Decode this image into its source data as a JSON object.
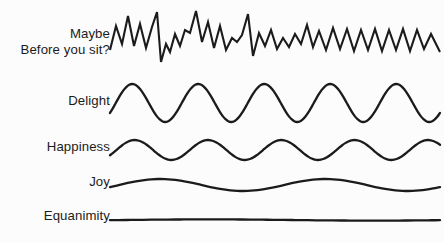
{
  "page": {
    "background_color": "#fcfcfc",
    "line_color": "#1b1b1b",
    "text_color": "#1b1b1b",
    "width": 444,
    "height": 242
  },
  "labels": {
    "maybe_line1": "Maybe",
    "maybe_line2": "Before you sit?",
    "delight": "Delight",
    "happiness": "Happiness",
    "joy": "Joy",
    "equanimity": "Equanimity"
  },
  "chart_data": {
    "type": "line",
    "xlabel": "",
    "ylabel": "",
    "grid": false,
    "legend_position": "left-labels",
    "axis_ranges": {
      "x": [
        110,
        440
      ],
      "y": [
        0,
        242
      ]
    },
    "series": [
      {
        "name": "Maybe / Before you sit?",
        "label_lines": [
          "Maybe",
          "Before you sit?"
        ],
        "waveform": "noisy-jagged",
        "baseline_y": 41,
        "amplitude": 26,
        "cycles": 24,
        "x_start": 110,
        "x_end": 440,
        "points": [
          [
            110,
            50
          ],
          [
            116,
            26
          ],
          [
            122,
            44
          ],
          [
            128,
            16
          ],
          [
            134,
            46
          ],
          [
            140,
            24
          ],
          [
            146,
            48
          ],
          [
            152,
            27
          ],
          [
            157,
            12
          ],
          [
            161,
            62
          ],
          [
            166,
            44
          ],
          [
            170,
            52
          ],
          [
            175,
            34
          ],
          [
            180,
            46
          ],
          [
            185,
            30
          ],
          [
            190,
            33
          ],
          [
            196,
            11
          ],
          [
            202,
            42
          ],
          [
            208,
            22
          ],
          [
            214,
            48
          ],
          [
            220,
            26
          ],
          [
            226,
            50
          ],
          [
            232,
            38
          ],
          [
            237,
            42
          ],
          [
            242,
            35
          ],
          [
            248,
            14
          ],
          [
            253,
            56
          ],
          [
            259,
            33
          ],
          [
            265,
            46
          ],
          [
            271,
            30
          ],
          [
            277,
            49
          ],
          [
            283,
            38
          ],
          [
            289,
            47
          ],
          [
            295,
            34
          ],
          [
            301,
            44
          ],
          [
            307,
            25
          ],
          [
            313,
            47
          ],
          [
            319,
            31
          ],
          [
            326,
            50
          ],
          [
            333,
            28
          ],
          [
            340,
            49
          ],
          [
            347,
            29
          ],
          [
            354,
            51
          ],
          [
            361,
            30
          ],
          [
            368,
            50
          ],
          [
            375,
            29
          ],
          [
            382,
            51
          ],
          [
            389,
            30
          ],
          [
            396,
            50
          ],
          [
            403,
            29
          ],
          [
            410,
            51
          ],
          [
            417,
            30
          ],
          [
            424,
            49
          ],
          [
            431,
            34
          ],
          [
            440,
            52
          ]
        ]
      },
      {
        "name": "Delight",
        "label_lines": [
          "Delight"
        ],
        "waveform": "sine",
        "baseline_y": 103,
        "amplitude": 19,
        "cycles": 5,
        "x_start": 110,
        "x_end": 440
      },
      {
        "name": "Happiness",
        "label_lines": [
          "Happiness"
        ],
        "waveform": "sine",
        "baseline_y": 150,
        "amplitude": 10,
        "cycles": 4.5,
        "x_start": 110,
        "x_end": 440
      },
      {
        "name": "Joy",
        "label_lines": [
          "Joy"
        ],
        "waveform": "sine",
        "baseline_y": 185,
        "amplitude": 6,
        "cycles": 2,
        "x_start": 110,
        "x_end": 440
      },
      {
        "name": "Equanimity",
        "label_lines": [
          "Equanimity"
        ],
        "waveform": "flat",
        "baseline_y": 220,
        "amplitude": 0.6,
        "cycles": 1,
        "x_start": 110,
        "x_end": 440
      }
    ]
  }
}
